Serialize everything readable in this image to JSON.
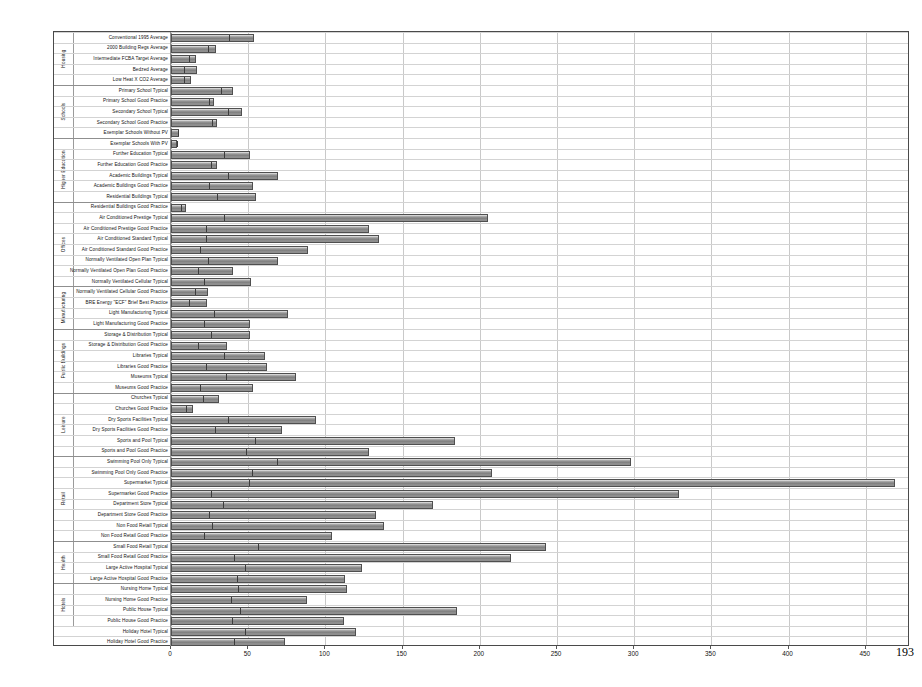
{
  "page": {
    "number": "193"
  },
  "chart_data": {
    "type": "bar",
    "orientation": "horizontal",
    "title": "",
    "xlabel": "",
    "ylabel": "",
    "xlim": [
      0,
      478
    ],
    "grid": true,
    "legend": null,
    "xticks": [
      0,
      50,
      100,
      150,
      200,
      250,
      300,
      350,
      400,
      450
    ],
    "ticklabels": [
      "0",
      "50",
      "100",
      "150",
      "200",
      "250",
      "300",
      "350",
      "400",
      "450"
    ],
    "groups": [
      {
        "name": "Housing",
        "count": 5
      },
      {
        "name": "Schools",
        "count": 5
      },
      {
        "name": "Higher Education",
        "count": 6
      },
      {
        "name": "Offices",
        "count": 8
      },
      {
        "name": "Manufacturing",
        "count": 4
      },
      {
        "name": "Public Buildings",
        "count": 6
      },
      {
        "name": "Leisure",
        "count": 6
      },
      {
        "name": "Retail",
        "count": 8
      },
      {
        "name": "Health",
        "count": 4
      },
      {
        "name": "Hotels",
        "count": 4
      }
    ],
    "categories": [
      "Conventional 1995 Average",
      "2000 Building Regs Average",
      "Intermediate FCBA Target Average",
      "Bedzed Average",
      "Low Heat  X CO2 Average",
      "Primary School Typical",
      "Primary School Good Practice",
      "Secondary School Typical",
      "Secondary School Good Practice",
      "Exemplar Schools  Without PV",
      "Exemplar Schools  With PV",
      "Further Education Typical",
      "Further Education Good Practice",
      "Academic Buildings Typical",
      "Academic Buildings Good Practice",
      "Residential Buildings Typical",
      "Residential Buildings Good Practice",
      "Air Conditioned Prestige Typical",
      "Air Conditioned Prestige Good Practice",
      "Air Conditioned Standard Typical",
      "Air Conditioned Standard Good Practice",
      "Normally Ventilated Open Plan Typical",
      "Normally Ventilated Open Plan Good Practice",
      "Normally Ventilated Cellular Typical",
      "Normally Ventilated Cellular Good Practice",
      "BRE Energy \"ECF\" Brief Best Practice",
      "Light Manufacturing Typical",
      "Light Manufacturing Good Practice",
      "Storage & Distribution Typical",
      "Storage & Distribution Good Practice",
      "Libraries Typical",
      "Libraries Good Practice",
      "Museums Typical",
      "Museums Good Practice",
      "Churches Typical",
      "Churches Good Practice",
      "Dry Sports Facilities Typical",
      "Dry Sports Facilities Good Practice",
      "Sports and Pool Typical",
      "Sports and Pool Good Practice",
      "Swimming Pool Only Typical",
      "Swimming Pool Only Good Practice",
      "Supermarket Typical",
      "Supermarket Good Practice",
      "Department Store Typical",
      "Department Store Good Practice",
      "Non Food Retail Typical",
      "Non Food Retail Good Practice",
      "Small Food Retail Typical",
      "Small Food Retail Good Practice",
      "Large Active Hospital Typical",
      "Large Active Hospital Good Practice",
      "Nursing Home Typical",
      "Nursing Home Good Practice",
      "Public House Typical",
      "Public House Good Practice",
      "Holiday Hotel Typical",
      "Holiday Hotel Good Practice"
    ],
    "series": [
      {
        "name": "Segment 1",
        "values": [
          37,
          23,
          11,
          8,
          8,
          32,
          24,
          36,
          26,
          4,
          3,
          34,
          25,
          36,
          24,
          29,
          6,
          34,
          22,
          22,
          18,
          23,
          17,
          21,
          15,
          11,
          27,
          21,
          25,
          17,
          34,
          22,
          35,
          18,
          20,
          9,
          36,
          28,
          54,
          48,
          68,
          52,
          50,
          25,
          33,
          24,
          26,
          21,
          56,
          40,
          47,
          42,
          43,
          38,
          44,
          39,
          47,
          40
        ],
        "color": "#8e8e8e"
      },
      {
        "name": "Segment 2",
        "values": [
          17,
          6,
          5,
          9,
          5,
          8,
          4,
          10,
          4,
          1,
          1,
          17,
          5,
          33,
          29,
          26,
          4,
          171,
          106,
          113,
          71,
          46,
          23,
          31,
          9,
          12,
          49,
          30,
          26,
          19,
          27,
          40,
          46,
          35,
          11,
          5,
          58,
          44,
          130,
          80,
          230,
          156,
          419,
          304,
          137,
          109,
          112,
          83,
          187,
          180,
          77,
          71,
          71,
          50,
          141,
          73,
          73,
          34
        ],
        "color": "#9d9d9d"
      }
    ],
    "totals": [
      54,
      29,
      16,
      17,
      13,
      40,
      28,
      46,
      30,
      5,
      4,
      51,
      30,
      69,
      53,
      55,
      10,
      205,
      128,
      135,
      89,
      69,
      40,
      52,
      24,
      23,
      76,
      51,
      51,
      36,
      61,
      62,
      81,
      53,
      31,
      14,
      94,
      72,
      184,
      128,
      298,
      208,
      469,
      329,
      170,
      133,
      138,
      104,
      243,
      220,
      124,
      113,
      114,
      88,
      185,
      112,
      120,
      74
    ]
  }
}
